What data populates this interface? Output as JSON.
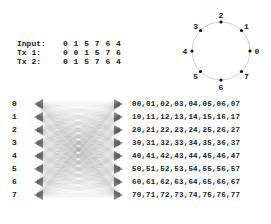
{
  "text_table": {
    "rows": [
      {
        "label": "Input:",
        "values": "0 1 5 7 6 4"
      },
      {
        "label": "Tx 1:",
        "values": "0 0 1 5 7 6"
      },
      {
        "label": "Tx 2:",
        "values": "0 1 5 7 6 4"
      }
    ]
  },
  "circle": {
    "nodes": [
      "0",
      "1",
      "2",
      "3",
      "4",
      "5",
      "6",
      "7"
    ],
    "color": "#cccccc"
  },
  "row_labels": [
    "0",
    "1",
    "2",
    "3",
    "4",
    "5",
    "6",
    "7"
  ],
  "matrix": [
    "00,01,02,03,04,05,06,07",
    "10,11,12,13,14,15,16,17",
    "20,21,22,23,24,25,26,27",
    "30,31,32,33,34,35,36,37",
    "40,41,42,43,44,45,46,47",
    "50,51,52,53,54,55,56,57",
    "60,61,62,63,64,65,66,67",
    "70,71,72,73,74,75,76,77"
  ]
}
